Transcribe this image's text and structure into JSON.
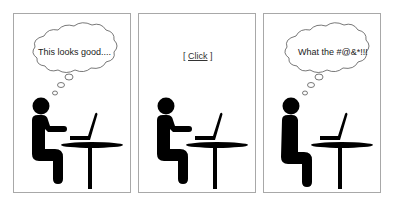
{
  "comic": {
    "panels": [
      {
        "caption": "This looks good...."
      },
      {
        "bracket_open": "[",
        "action": "Click",
        "bracket_close": "]"
      },
      {
        "caption": "What the #@&*!!!"
      }
    ]
  },
  "colors": {
    "border": "#a8a8a8",
    "figure": "#000000",
    "background": "#ffffff"
  }
}
